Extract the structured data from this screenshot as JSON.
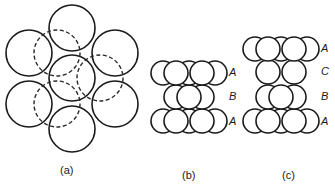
{
  "figure": {
    "stroke_color": "#1a1a1a"
  },
  "panels": [
    {
      "id": "a",
      "caption": "(a)",
      "caption_pos": [
        60,
        165
      ],
      "solid_circles": [
        {
          "cx": 72,
          "cy": 28,
          "r": 23
        },
        {
          "cx": 29,
          "cy": 53,
          "r": 23
        },
        {
          "cx": 115,
          "cy": 53,
          "r": 23
        },
        {
          "cx": 72,
          "cy": 78,
          "r": 23
        },
        {
          "cx": 29,
          "cy": 104,
          "r": 23
        },
        {
          "cx": 115,
          "cy": 104,
          "r": 23
        },
        {
          "cx": 72,
          "cy": 129,
          "r": 23
        }
      ],
      "dashed_circles": [
        {
          "cx": 57,
          "cy": 53,
          "r": 23
        },
        {
          "cx": 100,
          "cy": 78,
          "r": 23
        },
        {
          "cx": 57,
          "cy": 104,
          "r": 23
        }
      ]
    },
    {
      "id": "b",
      "caption": "(b)",
      "caption_pos": [
        182,
        170
      ],
      "layers": [
        {
          "label": "A",
          "label_pos": [
            229,
            67
          ],
          "back": [
            {
              "cx": 163,
              "cy": 73,
              "r": 12
            },
            {
              "cx": 189,
              "cy": 73,
              "r": 12
            },
            {
              "cx": 215,
              "cy": 73,
              "r": 12
            }
          ],
          "front": [
            {
              "cx": 176,
              "cy": 73,
              "r": 12
            },
            {
              "cx": 202,
              "cy": 73,
              "r": 12
            }
          ]
        },
        {
          "label": "B",
          "label_pos": [
            229,
            91
          ],
          "back": [
            {
              "cx": 176,
              "cy": 97,
              "r": 12
            },
            {
              "cx": 202,
              "cy": 97,
              "r": 12
            }
          ],
          "front": [
            {
              "cx": 189,
              "cy": 97,
              "r": 12
            }
          ]
        },
        {
          "label": "A",
          "label_pos": [
            229,
            116
          ],
          "back": [
            {
              "cx": 163,
              "cy": 121,
              "r": 12
            },
            {
              "cx": 189,
              "cy": 121,
              "r": 12
            },
            {
              "cx": 215,
              "cy": 121,
              "r": 12
            }
          ],
          "front": [
            {
              "cx": 176,
              "cy": 121,
              "r": 12
            },
            {
              "cx": 202,
              "cy": 121,
              "r": 12
            }
          ]
        }
      ]
    },
    {
      "id": "c",
      "caption": "(c)",
      "caption_pos": [
        282,
        170
      ],
      "layers": [
        {
          "label": "A",
          "label_pos": [
            321,
            43
          ],
          "back": [
            {
              "cx": 255,
              "cy": 49,
              "r": 12
            },
            {
              "cx": 281,
              "cy": 49,
              "r": 12
            },
            {
              "cx": 307,
              "cy": 49,
              "r": 12
            }
          ],
          "front": [
            {
              "cx": 268,
              "cy": 49,
              "r": 12
            },
            {
              "cx": 294,
              "cy": 49,
              "r": 12
            }
          ]
        },
        {
          "label": "C",
          "label_pos": [
            321,
            66
          ],
          "back": [],
          "front": [
            {
              "cx": 268,
              "cy": 72,
              "r": 12
            },
            {
              "cx": 294,
              "cy": 72,
              "r": 12
            }
          ]
        },
        {
          "label": "B",
          "label_pos": [
            321,
            91
          ],
          "back": [
            {
              "cx": 268,
              "cy": 97,
              "r": 12
            },
            {
              "cx": 294,
              "cy": 97,
              "r": 12
            }
          ],
          "front": [
            {
              "cx": 281,
              "cy": 97,
              "r": 12
            }
          ]
        },
        {
          "label": "A",
          "label_pos": [
            321,
            116
          ],
          "back": [
            {
              "cx": 255,
              "cy": 121,
              "r": 12
            },
            {
              "cx": 281,
              "cy": 121,
              "r": 12
            },
            {
              "cx": 307,
              "cy": 121,
              "r": 12
            }
          ],
          "front": [
            {
              "cx": 268,
              "cy": 121,
              "r": 12
            },
            {
              "cx": 294,
              "cy": 121,
              "r": 12
            }
          ]
        }
      ]
    }
  ]
}
